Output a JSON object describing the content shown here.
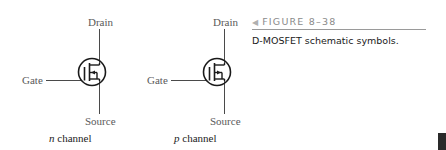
{
  "figure": {
    "number_label": "FIGURE 8–38",
    "pointer_icon": "left-triangle-icon",
    "caption": "D-MOSFET schematic symbols."
  },
  "symbols": [
    {
      "id": "n-channel",
      "terminals": {
        "drain": "Drain",
        "gate": "Gate",
        "source": "Source"
      },
      "channel_letter": "n",
      "channel_word": "channel",
      "arrow_direction": "inward"
    },
    {
      "id": "p-channel",
      "terminals": {
        "drain": "Drain",
        "gate": "Gate",
        "source": "Source"
      },
      "channel_letter": "p",
      "channel_word": "channel",
      "arrow_direction": "outward"
    }
  ],
  "colors": {
    "symbol_stroke": "#1a1a1a",
    "lead_stroke": "#4a4a4a",
    "label_text": "#5a5a5a",
    "heading_text": "#8a8a8a",
    "page_tab": "#2a2a2a"
  }
}
